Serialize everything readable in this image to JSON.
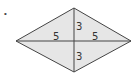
{
  "diagram": {
    "marker": "•",
    "shape": "rhombus",
    "colors": {
      "fill": "#e6e6e6",
      "stroke": "#444444",
      "text": "#333333"
    },
    "vertices": {
      "top": [
        74,
        8
      ],
      "right": [
        131,
        41
      ],
      "bottom": [
        74,
        72
      ],
      "left": [
        16,
        41
      ]
    },
    "labels": [
      {
        "id": "left-half-horizontal",
        "text": "5",
        "x": 56,
        "y": 41
      },
      {
        "id": "right-half-horizontal",
        "text": "5",
        "x": 95,
        "y": 41
      },
      {
        "id": "top-half-vertical",
        "text": "3",
        "x": 78,
        "y": 30
      },
      {
        "id": "bottom-half-vertical",
        "text": "3",
        "x": 78,
        "y": 60
      }
    ]
  }
}
